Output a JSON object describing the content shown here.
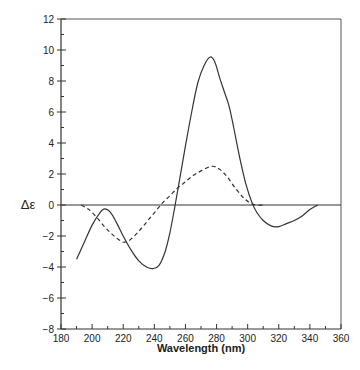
{
  "chart_data": {
    "type": "line",
    "title": "",
    "xlabel": "Wavelength  (nm)",
    "ylabel": "Δε",
    "xlim": [
      180,
      360
    ],
    "ylim": [
      -8,
      12
    ],
    "x_ticks": [
      180,
      200,
      220,
      240,
      260,
      280,
      300,
      320,
      340,
      360
    ],
    "y_ticks": [
      -8,
      -6,
      -4,
      -2,
      0,
      2,
      4,
      6,
      8,
      10,
      12
    ],
    "x_minor_step": 10,
    "y_minor_step": 1,
    "zero_line": true,
    "grid": false,
    "legend": null,
    "series": [
      {
        "name": "solid",
        "style": "solid",
        "x": [
          190,
          195,
          200,
          205,
          208,
          212,
          216,
          220,
          225,
          230,
          235,
          239,
          243,
          247,
          250,
          253,
          256,
          260,
          264,
          268,
          272,
          276,
          279,
          282,
          285,
          288,
          291,
          295,
          299,
          303,
          306,
          310,
          315,
          320,
          325,
          330,
          335,
          340,
          345
        ],
        "y": [
          -3.5,
          -2.4,
          -1.3,
          -0.5,
          -0.25,
          -0.5,
          -1.2,
          -2.0,
          -2.9,
          -3.6,
          -4.0,
          -4.1,
          -3.9,
          -3.0,
          -1.8,
          -0.2,
          1.5,
          3.8,
          6.0,
          7.9,
          9.0,
          9.55,
          9.2,
          8.2,
          7.3,
          6.4,
          5.0,
          3.0,
          1.3,
          0.1,
          -0.5,
          -1.0,
          -1.35,
          -1.4,
          -1.2,
          -1.0,
          -0.7,
          -0.3,
          0.0
        ]
      },
      {
        "name": "dashed",
        "style": "dashed",
        "x": [
          193,
          198,
          203,
          208,
          213,
          218,
          221,
          225,
          230,
          235,
          240,
          245,
          250,
          255,
          260,
          265,
          270,
          277,
          282,
          287,
          292,
          297,
          302,
          306,
          310
        ],
        "y": [
          0.0,
          -0.3,
          -0.8,
          -1.4,
          -1.9,
          -2.3,
          -2.4,
          -2.2,
          -1.7,
          -1.1,
          -0.5,
          0.1,
          0.6,
          1.1,
          1.5,
          1.9,
          2.2,
          2.5,
          2.3,
          1.8,
          1.1,
          0.5,
          0.1,
          0.0,
          0.0
        ]
      }
    ]
  }
}
